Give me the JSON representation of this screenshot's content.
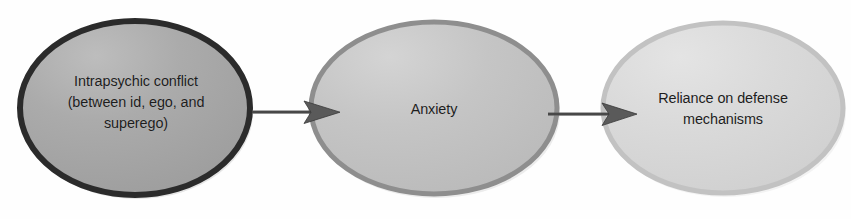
{
  "diagram": {
    "type": "flow-diagram",
    "background_color": "#fefefe",
    "text_color": "#1d1d1d",
    "nodes": [
      {
        "id": "node-1",
        "label": "Intrapsychic conflict\n(between id, ego, and\nsuperego)",
        "shape": "ellipse",
        "fill_color": "#a9a9a9",
        "stroke_color": "#2b2b2b",
        "stroke_width": 6,
        "cx": 135,
        "cy": 108,
        "rx": 118,
        "ry": 90
      },
      {
        "id": "node-2",
        "label": "Anxiety",
        "shape": "ellipse",
        "fill_color": "#c3c3c3",
        "stroke_color": "#8e8e8e",
        "stroke_width": 5,
        "cx": 434,
        "cy": 108,
        "rx": 126,
        "ry": 89
      },
      {
        "id": "node-3",
        "label": "Reliance on defense\nmechanisms",
        "shape": "ellipse",
        "fill_color": "#d8d8d8",
        "stroke_color": "#bcbcbc",
        "stroke_width": 5,
        "cx": 723,
        "cy": 108,
        "rx": 123,
        "ry": 88
      }
    ],
    "arrows": [
      {
        "id": "arrow-1",
        "from": "node-1",
        "to": "node-2",
        "color": "#4a4a4a",
        "x_start": 252,
        "x_end": 338,
        "y": 112
      },
      {
        "id": "arrow-2",
        "from": "node-2",
        "to": "node-3",
        "color": "#4a4a4a",
        "x_start": 548,
        "x_end": 633,
        "y": 114
      }
    ]
  }
}
